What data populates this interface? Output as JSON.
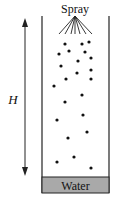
{
  "diagram": {
    "spray_label": "Spray",
    "height_label": "H",
    "water_label": "Water",
    "colors": {
      "line": "#222222",
      "water_fill": "#a9a9a9",
      "droplet": "#111111",
      "background": "#ffffff"
    },
    "column": {
      "left_x": 42,
      "right_x": 109,
      "top_y": 16,
      "bottom_y": 193
    },
    "water": {
      "x": 42,
      "y": 177,
      "width": 67,
      "height": 16
    },
    "height_arrow": {
      "x": 25,
      "top_y": 18,
      "bottom_y": 176
    },
    "spray_nozzle": {
      "x": 75,
      "y": 16,
      "spread_y": 34,
      "ends_x": [
        59,
        65,
        71,
        75,
        80,
        86,
        92
      ]
    },
    "droplets": [
      [
        65,
        44
      ],
      [
        82,
        44
      ],
      [
        89,
        42
      ],
      [
        59,
        54
      ],
      [
        69,
        51
      ],
      [
        85,
        52
      ],
      [
        78,
        61
      ],
      [
        91,
        58
      ],
      [
        61,
        66
      ],
      [
        91,
        70
      ],
      [
        77,
        73
      ],
      [
        66,
        79
      ],
      [
        91,
        79
      ],
      [
        54,
        86
      ],
      [
        82,
        95
      ],
      [
        65,
        102
      ],
      [
        83,
        115
      ],
      [
        57,
        120
      ],
      [
        87,
        132
      ],
      [
        68,
        138
      ],
      [
        74,
        157
      ],
      [
        57,
        162
      ],
      [
        91,
        168
      ]
    ]
  }
}
